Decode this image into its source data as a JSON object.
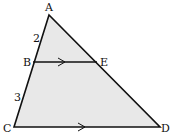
{
  "diagram": {
    "fill_color": "#e8e8e8",
    "stroke_color": "#111111",
    "points": {
      "A": {
        "label": "A"
      },
      "B": {
        "label": "B"
      },
      "C": {
        "label": "C"
      },
      "D": {
        "label": "D"
      },
      "E": {
        "label": "E"
      }
    },
    "segment_labels": {
      "AB": "2",
      "BC": "3"
    },
    "parallel_marks": [
      "BE",
      "CD"
    ]
  }
}
